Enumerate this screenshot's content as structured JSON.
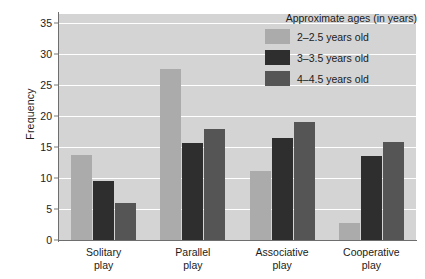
{
  "chart_data": {
    "type": "bar",
    "title": "",
    "xlabel": "",
    "ylabel": "Frequency",
    "ylim": [
      0,
      36.5
    ],
    "yticks": [
      0,
      5,
      10,
      15,
      20,
      25,
      30,
      35
    ],
    "grid": true,
    "legend_position": "top-right",
    "legend_title": "Approximate ages (in years)",
    "categories": [
      "Solitary play",
      "Parallel play",
      "Associative play",
      "Cooperative play"
    ],
    "category_lines": [
      [
        "Solitary",
        "play"
      ],
      [
        "Parallel",
        "play"
      ],
      [
        "Associative",
        "play"
      ],
      [
        "Cooperative",
        "play"
      ]
    ],
    "series": [
      {
        "name": "2–2.5 years old",
        "color": "#ababab",
        "values": [
          13.8,
          27.7,
          11.2,
          2.8
        ]
      },
      {
        "name": "3–3.5 years old",
        "color": "#2e2e2e",
        "values": [
          9.5,
          15.7,
          16.5,
          13.6
        ]
      },
      {
        "name": "4–4.5 years old",
        "color": "#555555",
        "values": [
          6.0,
          18.0,
          19.0,
          15.8
        ]
      }
    ]
  },
  "axes": {
    "y_title": "Frequency",
    "y_tick_labels": [
      "0",
      "5",
      "10",
      "15",
      "20",
      "25",
      "30",
      "35"
    ]
  },
  "legend": {
    "title": "Approximate ages (in years)",
    "items": [
      {
        "label": "2–2.5 years old"
      },
      {
        "label": "3–3.5 years old"
      },
      {
        "label": "4–4.5 years old"
      }
    ]
  },
  "colors": {
    "plot_background": "#d4d4d4",
    "gridline": "#ffffff",
    "axis": "#6e6e6e",
    "text": "#1b1b1b",
    "series_1": "#ababab",
    "series_2": "#2e2e2e",
    "series_3": "#555555"
  }
}
